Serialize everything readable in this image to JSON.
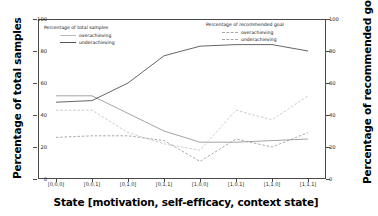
{
  "chart_data": {
    "type": "line",
    "title": "",
    "xlabel": "State [motivation, self-efficacy, context state]",
    "ylabel": "Percentage of total samples",
    "ylabel_right": "Percentage of recommended goal",
    "categories": [
      "[0,0,0]",
      "[0,0,1]",
      "[0,1,0]",
      "[0,1,1]",
      "[1,0,0]",
      "[1,0,1]",
      "[1,1,0]",
      "[1,1,1]"
    ],
    "ylim": [
      0,
      100
    ],
    "ylim_right": [
      0,
      100
    ],
    "yticks": [
      0,
      20,
      40,
      60,
      80,
      100
    ],
    "yticks_right": [
      0,
      20,
      40,
      60,
      80,
      100
    ],
    "grid": false,
    "legend_position": "upper-left and upper-right inside axes",
    "series": [
      {
        "name": "overachieving",
        "group": "Percentage of total samples",
        "axis": "left",
        "style": "solid",
        "color": "#9a9a9a",
        "values": [
          52,
          52,
          41,
          30,
          23,
          23,
          24,
          25
        ]
      },
      {
        "name": "underachieving",
        "group": "Percentage of total samples",
        "axis": "left",
        "style": "solid",
        "color": "#555555",
        "values": [
          48,
          49,
          60,
          77,
          83,
          84,
          84,
          80
        ]
      },
      {
        "name": "overachieving",
        "group": "Percentage of recommended goal",
        "axis": "right",
        "style": "dashed",
        "color": "#c4c4c4",
        "values": [
          43,
          43,
          29,
          22,
          18,
          43,
          37,
          52
        ]
      },
      {
        "name": "underachieving",
        "group": "Percentage of recommended goal",
        "axis": "right",
        "style": "dashed",
        "color": "#9e9e9e",
        "values": [
          26,
          27,
          27,
          24,
          11,
          25,
          20,
          29
        ]
      }
    ]
  },
  "legend_left": {
    "title": "Percentage of total samples",
    "items": [
      {
        "label": "overachieving"
      },
      {
        "label": "underachieving"
      }
    ]
  },
  "legend_right": {
    "title": "Percentage of recommended goal",
    "items": [
      {
        "label": "overachieving"
      },
      {
        "label": "underachieving"
      }
    ]
  }
}
